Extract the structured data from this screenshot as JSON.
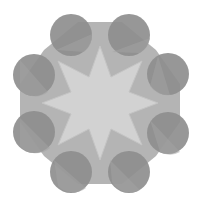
{
  "figure": {
    "colors": {
      "background": "#ffffff",
      "octagon": "#b4b4b4",
      "star": "#d2d2d2",
      "circle": "#8e8e8e",
      "circle_overlap": "#a3a3a3"
    },
    "center": [
      100,
      103
    ],
    "circle_radius": 21,
    "circles": [
      {
        "id": "top-left",
        "cx": 71,
        "cy": 35
      },
      {
        "id": "top-right",
        "cx": 129,
        "cy": 35
      },
      {
        "id": "right-top",
        "cx": 168,
        "cy": 74
      },
      {
        "id": "right-bottom",
        "cx": 168,
        "cy": 133
      },
      {
        "id": "bottom-right",
        "cx": 129,
        "cy": 172
      },
      {
        "id": "bottom-left",
        "cx": 71,
        "cy": 172
      },
      {
        "id": "left-bottom",
        "cx": 34,
        "cy": 132
      },
      {
        "id": "left-top",
        "cx": 34,
        "cy": 75
      }
    ]
  }
}
